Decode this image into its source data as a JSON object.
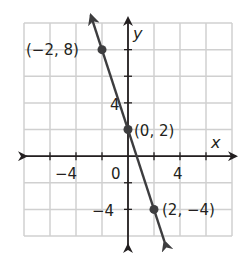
{
  "chart_data": {
    "type": "line",
    "title": "",
    "xlabel": "x",
    "ylabel": "y",
    "xlim": [
      -8,
      8
    ],
    "ylim": [
      -6,
      10
    ],
    "grid": true,
    "grid_spacing": 2,
    "x_tick_labels": [
      "-4",
      "0",
      "4"
    ],
    "y_tick_labels": [
      "4",
      "-4"
    ],
    "x_tick_label_text": {
      "neg4": "−4",
      "zero": "0",
      "pos4": "4"
    },
    "y_tick_label_text": {
      "pos4": "4",
      "neg4": "−4"
    },
    "series": [
      {
        "name": "line",
        "equation": "y = -3x + 2",
        "slope": -3,
        "intercept": 2,
        "color": "#3d3d3f",
        "points": [
          {
            "x": -2,
            "y": 8,
            "label": "(−2, 8)"
          },
          {
            "x": 0,
            "y": 2,
            "label": "(0, 2)"
          },
          {
            "x": 2,
            "y": -4,
            "label": "(2, −4)"
          }
        ]
      }
    ],
    "colors": {
      "grid": "#d0d0d0",
      "axis": "#231f20",
      "line": "#3d3d3f",
      "text": "#231f20"
    }
  }
}
